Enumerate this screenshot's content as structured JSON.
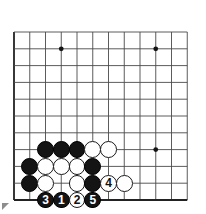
{
  "diagram": {
    "kind": "go-board-diagram",
    "board": {
      "line_color": "#4a4a4a",
      "edge_color": "#222222",
      "background": "#ffffff",
      "columns": 12,
      "rows": 11,
      "origin_x": 14,
      "origin_y": 32,
      "spacing_x": 15.75,
      "spacing_y": 16.8,
      "star_points": [
        {
          "col": 3,
          "row": 1
        },
        {
          "col": 9,
          "row": 1
        },
        {
          "col": 9,
          "row": 7
        }
      ]
    },
    "stones": [
      {
        "col": 2,
        "row": 7,
        "color": "black"
      },
      {
        "col": 3,
        "row": 7,
        "color": "black"
      },
      {
        "col": 4,
        "row": 7,
        "color": "black"
      },
      {
        "col": 5,
        "row": 7,
        "color": "white"
      },
      {
        "col": 6,
        "row": 7,
        "color": "white"
      },
      {
        "col": 1,
        "row": 8,
        "color": "black"
      },
      {
        "col": 2,
        "row": 8,
        "color": "white"
      },
      {
        "col": 3,
        "row": 8,
        "color": "white"
      },
      {
        "col": 4,
        "row": 8,
        "color": "white"
      },
      {
        "col": 5,
        "row": 8,
        "color": "black"
      },
      {
        "col": 1,
        "row": 9,
        "color": "black"
      },
      {
        "col": 2,
        "row": 9,
        "color": "white"
      },
      {
        "col": 4,
        "row": 9,
        "color": "white"
      },
      {
        "col": 5,
        "row": 9,
        "color": "black"
      },
      {
        "col": 7,
        "row": 9,
        "color": "white"
      }
    ],
    "moves": [
      {
        "number": "3",
        "col": 2,
        "row": 10,
        "color": "black"
      },
      {
        "number": "1",
        "col": 3,
        "row": 10,
        "color": "black"
      },
      {
        "number": "2",
        "col": 4,
        "row": 10,
        "color": "white"
      },
      {
        "number": "5",
        "col": 5,
        "row": 10,
        "color": "black"
      },
      {
        "number": "4",
        "col": 6,
        "row": 9,
        "color": "white"
      }
    ],
    "stone_radius": 8.4,
    "marker_radius": 8.4,
    "marker_font_size": 12
  }
}
